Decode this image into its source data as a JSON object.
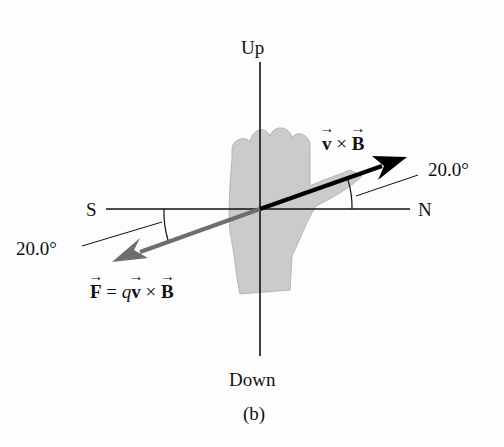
{
  "figure": {
    "axes": {
      "up": "Up",
      "down": "Down",
      "north": "N",
      "south": "S"
    },
    "vectors": {
      "v_cross_b": {
        "v": "v",
        "times": " × ",
        "b": "B",
        "angle_label": "20.0°",
        "color": "#000000"
      },
      "force": {
        "f": "F",
        "eq": " = ",
        "q": "q",
        "v": "v",
        "times": " × ",
        "b": "B",
        "angle_label": "20.0°",
        "color": "#6e6e6e"
      }
    },
    "caption": "(b)",
    "hand_color": "#c8c8c8"
  }
}
